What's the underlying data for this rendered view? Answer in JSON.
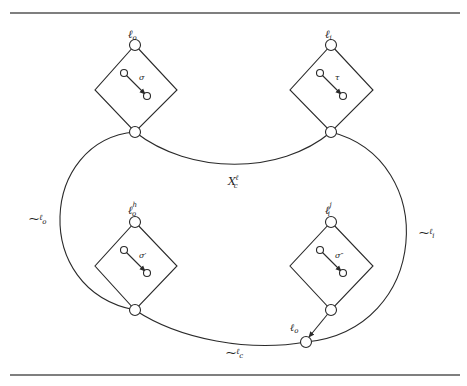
{
  "figure": {
    "diamonds": [
      {
        "id": "top-left",
        "top_label": "ℓ",
        "top_sub": "o",
        "top_sup": "",
        "inner_label": "σ"
      },
      {
        "id": "top-right",
        "top_label": "ℓ",
        "top_sub": "i",
        "top_sup": "",
        "inner_label": "τ"
      },
      {
        "id": "bottom-left",
        "top_label": "ℓ",
        "top_sub": "o",
        "top_sup": "h",
        "inner_label": "σ′"
      },
      {
        "id": "bottom-right",
        "top_label": "ℓ",
        "top_sub": "i",
        "top_sup": "j",
        "inner_label": "σ″"
      }
    ],
    "curve_labels": {
      "top_middle": {
        "main": "X",
        "sup": "ℓ",
        "sub": "c"
      },
      "left": {
        "prefix": "⁓",
        "main": "ℓ",
        "sub": "o"
      },
      "right": {
        "prefix": "⁓",
        "main": "ℓ",
        "sub": "i"
      },
      "bottom": {
        "prefix": "⁓",
        "main": "ℓ",
        "sub": "c"
      }
    },
    "junction_label": {
      "main": "ℓ",
      "sub": "o"
    }
  }
}
